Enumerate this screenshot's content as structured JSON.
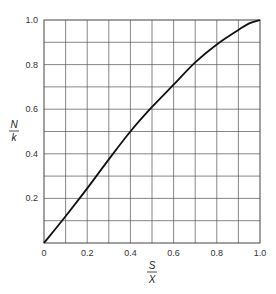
{
  "chart_data": {
    "type": "line",
    "title": "",
    "xlabel": {
      "numerator": "S",
      "denominator": "X"
    },
    "ylabel": {
      "numerator": "N",
      "denominator": "k"
    },
    "xlim": [
      0,
      1.0
    ],
    "ylim": [
      0,
      1.0
    ],
    "grid": true,
    "grid_step": 0.1,
    "x_ticks": [
      "0",
      "0.2",
      "0.4",
      "0.6",
      "0.8",
      "1.0"
    ],
    "y_ticks": [
      "0.2",
      "0.4",
      "0.6",
      "0.8",
      "1.0"
    ],
    "series": [
      {
        "name": "N/k vs S/X",
        "x": [
          0.0,
          0.1,
          0.2,
          0.3,
          0.4,
          0.5,
          0.6,
          0.7,
          0.8,
          0.9,
          0.95,
          1.0
        ],
        "y": [
          0.0,
          0.12,
          0.245,
          0.375,
          0.5,
          0.61,
          0.71,
          0.81,
          0.89,
          0.955,
          0.985,
          1.0
        ]
      }
    ],
    "legend": null
  },
  "colors": {
    "grid": "#555555",
    "line": "#111111",
    "text": "#333333"
  }
}
